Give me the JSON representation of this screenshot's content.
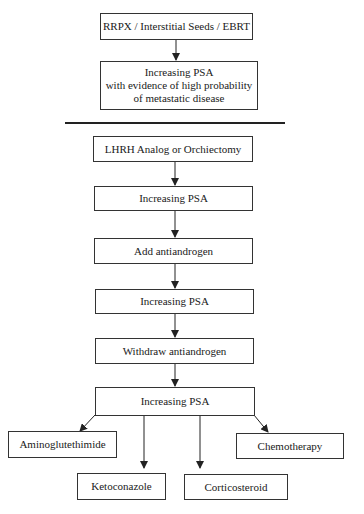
{
  "diagram": {
    "top_section": {
      "boxes": [
        {
          "id": "treatment",
          "label": "RRPX / Interstitial Seeds / EBRT"
        },
        {
          "id": "psa_metastatic",
          "lines": [
            "Increasing PSA",
            "with evidence of high probability",
            "of metastatic disease"
          ]
        }
      ]
    },
    "bottom_section": {
      "boxes": [
        {
          "id": "lhrh",
          "label": "LHRH Analog or Orchiectomy"
        },
        {
          "id": "psa1",
          "label": "Increasing PSA"
        },
        {
          "id": "add_antiandrogen",
          "label": "Add antiandrogen"
        },
        {
          "id": "psa2",
          "label": "Increasing PSA"
        },
        {
          "id": "withdraw_antiandrogen",
          "label": "Withdraw antiandrogen"
        },
        {
          "id": "psa3",
          "label": "Increasing PSA"
        }
      ],
      "options": [
        {
          "id": "aminoglutethimide",
          "label": "Aminoglutethimide"
        },
        {
          "id": "ketoconazole",
          "label": "Ketoconazole"
        },
        {
          "id": "corticosteroid",
          "label": "Corticosteroid"
        },
        {
          "id": "chemotherapy",
          "label": "Chemotherapy"
        }
      ]
    }
  }
}
